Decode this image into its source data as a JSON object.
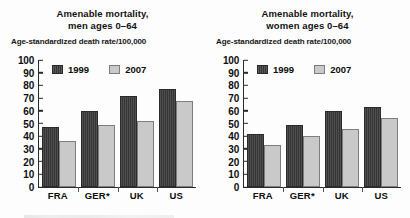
{
  "charts": [
    {
      "panel_name": "men",
      "title": "Amenable mortality,\nmen ages 0–64",
      "axis_note": "Age-standardized death rate/100,000",
      "legend": [
        {
          "label": "1999",
          "swatch": "dark-swatch-icon",
          "color": "#3b3b3b"
        },
        {
          "label": "2007",
          "swatch": "light-swatch-icon",
          "color": "#c9c9c9"
        }
      ],
      "yticks": [
        "100",
        "90",
        "80",
        "70",
        "60",
        "50",
        "40",
        "30",
        "20",
        "10",
        "0"
      ],
      "categories": [
        "FRA",
        "GER*",
        "UK",
        "US"
      ]
    },
    {
      "panel_name": "women",
      "title": "Amenable mortality,\nwomen ages 0–64",
      "axis_note": "Age-standardized death rate/100,000",
      "legend": [
        {
          "label": "1999",
          "swatch": "dark-swatch-icon",
          "color": "#3b3b3b"
        },
        {
          "label": "2007",
          "swatch": "light-swatch-icon",
          "color": "#c9c9c9"
        }
      ],
      "yticks": [
        "100",
        "90",
        "80",
        "70",
        "60",
        "50",
        "40",
        "30",
        "20",
        "10",
        "0"
      ],
      "categories": [
        "FRA",
        "GER*",
        "UK",
        "US"
      ]
    }
  ],
  "chart_data": [
    {
      "type": "bar",
      "title": "Amenable mortality, men ages 0–64",
      "subtitle": "Age-standardized death rate/100,000",
      "xlabel": "",
      "ylabel": "Age-standardized death rate/100,000",
      "ylim": [
        0,
        100
      ],
      "ytick_step": 10,
      "grid": false,
      "legend_position": "top-inside",
      "categories": [
        "FRA",
        "GER*",
        "UK",
        "US"
      ],
      "series": [
        {
          "name": "1999",
          "color": "#3b3b3b",
          "values": [
            47,
            60,
            72,
            77.5
          ]
        },
        {
          "name": "2007",
          "color": "#c9c9c9",
          "values": [
            36.5,
            49,
            52,
            68
          ]
        }
      ]
    },
    {
      "type": "bar",
      "title": "Amenable mortality, women ages 0–64",
      "subtitle": "Age-standardized death rate/100,000",
      "xlabel": "",
      "ylabel": "Age-standardized death rate/100,000",
      "ylim": [
        0,
        100
      ],
      "ytick_step": 10,
      "grid": false,
      "legend_position": "top-inside",
      "categories": [
        "FRA",
        "GER*",
        "UK",
        "US"
      ],
      "series": [
        {
          "name": "1999",
          "color": "#3b3b3b",
          "values": [
            42,
            48.5,
            60,
            63
          ]
        },
        {
          "name": "2007",
          "color": "#c9c9c9",
          "values": [
            33,
            40,
            45.5,
            54
          ]
        }
      ]
    }
  ]
}
